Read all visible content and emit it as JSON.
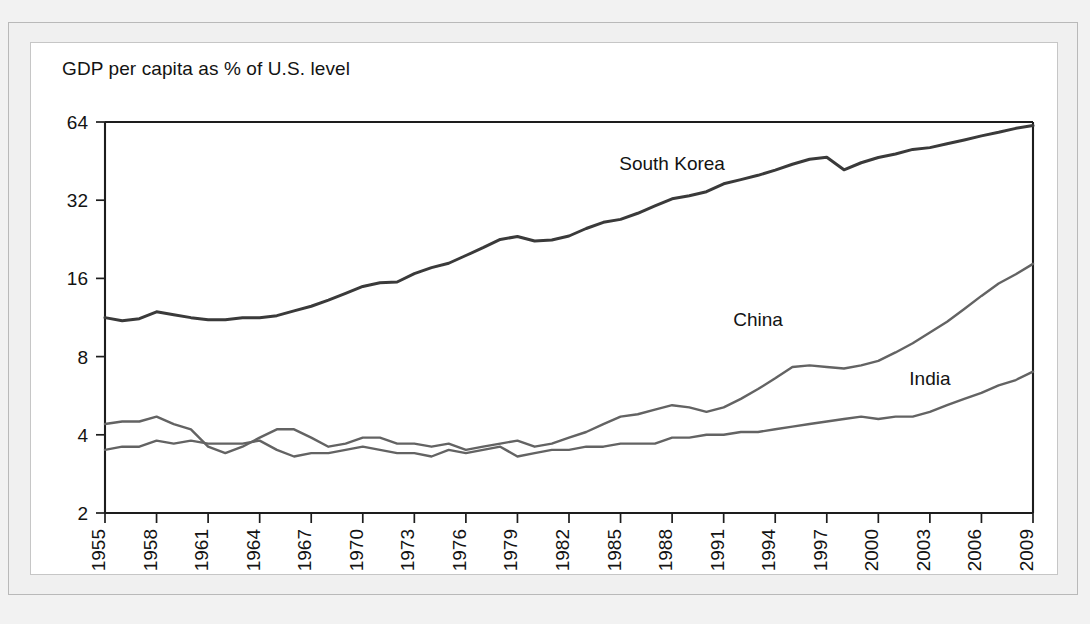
{
  "figure": {
    "title": "GDP per capita as % of U.S. level",
    "frame_color": "#b9b9b9",
    "panel_color": "#ffffff",
    "page_color": "#f2f2f2"
  },
  "chart_data": {
    "type": "line",
    "title": "GDP per capita as % of U.S. level",
    "xlabel": "",
    "ylabel": "",
    "yscale": "log",
    "ylim": [
      2,
      64
    ],
    "ytick_labels": [
      "2",
      "4",
      "8",
      "16",
      "32",
      "64"
    ],
    "ytick_values": [
      2,
      4,
      8,
      16,
      32,
      64
    ],
    "xlim": [
      1955,
      2009
    ],
    "xtick_labels": [
      "1955",
      "1958",
      "1961",
      "1964",
      "1967",
      "1970",
      "1973",
      "1976",
      "1979",
      "1982",
      "1985",
      "1988",
      "1991",
      "1994",
      "1997",
      "2000",
      "2003",
      "2006",
      "2009"
    ],
    "xtick_values": [
      1955,
      1958,
      1961,
      1964,
      1967,
      1970,
      1973,
      1976,
      1979,
      1982,
      1985,
      1988,
      1991,
      1994,
      1997,
      2000,
      2003,
      2006,
      2009
    ],
    "grid": false,
    "legend_position": "inline-annotations",
    "x": [
      1955,
      1956,
      1957,
      1958,
      1959,
      1960,
      1961,
      1962,
      1963,
      1964,
      1965,
      1966,
      1967,
      1968,
      1969,
      1970,
      1971,
      1972,
      1973,
      1974,
      1975,
      1976,
      1977,
      1978,
      1979,
      1980,
      1981,
      1982,
      1983,
      1984,
      1985,
      1986,
      1987,
      1988,
      1989,
      1990,
      1991,
      1992,
      1993,
      1994,
      1995,
      1996,
      1997,
      1998,
      1999,
      2000,
      2001,
      2002,
      2003,
      2004,
      2005,
      2006,
      2007,
      2008,
      2009
    ],
    "series": [
      {
        "name": "South Korea",
        "color": "#3a3a3a",
        "label_x": 1988,
        "label_y": 42,
        "values": [
          11.3,
          11.0,
          11.2,
          11.9,
          11.6,
          11.3,
          11.1,
          11.1,
          11.3,
          11.3,
          11.5,
          12.0,
          12.5,
          13.2,
          14.0,
          14.9,
          15.4,
          15.5,
          16.7,
          17.6,
          18.3,
          19.6,
          21.0,
          22.6,
          23.2,
          22.3,
          22.5,
          23.3,
          24.9,
          26.3,
          27.0,
          28.5,
          30.4,
          32.4,
          33.3,
          34.5,
          37.0,
          38.4,
          39.9,
          41.8,
          44.0,
          46.0,
          46.8,
          41.9,
          44.6,
          46.7,
          48.2,
          50.2,
          51.0,
          52.8,
          54.6,
          56.6,
          58.4,
          60.5,
          62.0
        ]
      },
      {
        "name": "China",
        "color": "#636363",
        "label_x": 1993,
        "label_y": 10.5,
        "values": [
          4.4,
          4.5,
          4.5,
          4.7,
          4.4,
          4.2,
          3.6,
          3.4,
          3.6,
          3.9,
          4.2,
          4.2,
          3.9,
          3.6,
          3.7,
          3.9,
          3.9,
          3.7,
          3.7,
          3.6,
          3.7,
          3.5,
          3.6,
          3.7,
          3.8,
          3.6,
          3.7,
          3.9,
          4.1,
          4.4,
          4.7,
          4.8,
          5.0,
          5.2,
          5.1,
          4.9,
          5.1,
          5.5,
          6.0,
          6.6,
          7.3,
          7.4,
          7.3,
          7.2,
          7.4,
          7.7,
          8.3,
          9.0,
          9.9,
          10.9,
          12.2,
          13.7,
          15.3,
          16.6,
          18.2
        ]
      },
      {
        "name": "India",
        "color": "#636363",
        "label_x": 2003,
        "label_y": 6.2,
        "values": [
          3.5,
          3.6,
          3.6,
          3.8,
          3.7,
          3.8,
          3.7,
          3.7,
          3.7,
          3.8,
          3.5,
          3.3,
          3.4,
          3.4,
          3.5,
          3.6,
          3.5,
          3.4,
          3.4,
          3.3,
          3.5,
          3.4,
          3.5,
          3.6,
          3.3,
          3.4,
          3.5,
          3.5,
          3.6,
          3.6,
          3.7,
          3.7,
          3.7,
          3.9,
          3.9,
          4.0,
          4.0,
          4.1,
          4.1,
          4.2,
          4.3,
          4.4,
          4.5,
          4.6,
          4.7,
          4.6,
          4.7,
          4.7,
          4.9,
          5.2,
          5.5,
          5.8,
          6.2,
          6.5,
          7.0
        ]
      }
    ]
  }
}
